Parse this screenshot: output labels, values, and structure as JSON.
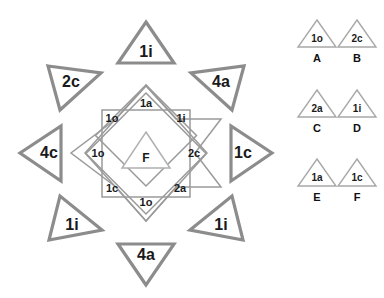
{
  "diagram": {
    "title": "",
    "colors": {
      "outer_stroke": "#8c8c8c",
      "star_stroke": "#9a9a9a",
      "center_stroke": "#b0b0b0",
      "legend_stroke": "#a8a8a8",
      "text": "#1a1a1a",
      "background": "#ffffff"
    },
    "outer_triangles": [
      {
        "label": "1i",
        "position": "top",
        "direction": "up"
      },
      {
        "label": "4a",
        "position": "top-right",
        "direction": "down-left"
      },
      {
        "label": "1c",
        "position": "right",
        "direction": "right"
      },
      {
        "label": "1i",
        "position": "bottom-right",
        "direction": "up-left"
      },
      {
        "label": "4a",
        "position": "bottom",
        "direction": "down"
      },
      {
        "label": "1i",
        "position": "bottom-left",
        "direction": "up-right"
      },
      {
        "label": "4c",
        "position": "left",
        "direction": "left"
      },
      {
        "label": "2c",
        "position": "top-left",
        "direction": "down-right"
      }
    ],
    "star_points": [
      {
        "label": "1a",
        "position": "top"
      },
      {
        "label": "1i",
        "position": "top-right"
      },
      {
        "label": "2c",
        "position": "right"
      },
      {
        "label": "2a",
        "position": "bottom-right"
      },
      {
        "label": "1o",
        "position": "bottom"
      },
      {
        "label": "1c",
        "position": "bottom-left"
      },
      {
        "label": "1o",
        "position": "left"
      },
      {
        "label": "1o",
        "position": "top-left"
      }
    ],
    "center": {
      "label": "F"
    }
  },
  "legend": {
    "items": [
      {
        "key": "A",
        "code": "1o"
      },
      {
        "key": "B",
        "code": "2c"
      },
      {
        "key": "C",
        "code": "2a"
      },
      {
        "key": "D",
        "code": "1i"
      },
      {
        "key": "E",
        "code": "1a"
      },
      {
        "key": "F",
        "code": "1c"
      }
    ]
  }
}
